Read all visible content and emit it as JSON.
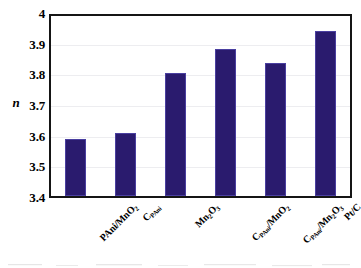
{
  "chart_data": {
    "type": "bar",
    "title": "",
    "xlabel": "",
    "ylabel": "n",
    "ylim": [
      3.4,
      4.0
    ],
    "ytick_labels": [
      "3.4",
      "3.5",
      "3.6",
      "3.7",
      "3.8",
      "3.9",
      "4"
    ],
    "ytick_values": [
      3.4,
      3.5,
      3.6,
      3.7,
      3.8,
      3.9,
      4.0
    ],
    "grid": "horizontal",
    "legend": "none",
    "bar_color": "#2a1b6e",
    "categories": [
      "PAni/MnO2",
      "CPAni",
      "Mn2O3",
      "CPAni/MnO2",
      "CPAni/Mn2O3",
      "Pt/C"
    ],
    "category_labels_html": [
      "PAni/MnO<sub>2</sub>",
      "C<span class=\"sm\">PAni</span>",
      "Mn<sub>2</sub>O<sub>3</sub>",
      "C<span class=\"sm\">PAni</span>/MnO<sub>2</sub>",
      "C<span class=\"sm\">PAni</span>/Mn<sub>2</sub>O<sub>3</sub>",
      "Pt/C"
    ],
    "values": [
      3.59,
      3.61,
      3.81,
      3.89,
      3.845,
      3.95
    ]
  }
}
